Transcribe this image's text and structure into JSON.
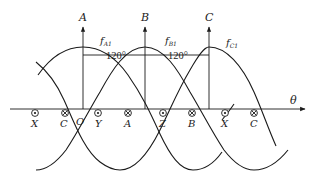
{
  "diagram": {
    "type": "three-phase-mmf-waveforms",
    "horizontal_axis_label": "θ",
    "origin_label": "O",
    "phase_axes": [
      {
        "label": "A",
        "x": 83
      },
      {
        "label": "B",
        "x": 145
      },
      {
        "label": "C",
        "x": 209
      }
    ],
    "waves": [
      {
        "label_main": "f",
        "label_sub": "A1",
        "peak_x": 83
      },
      {
        "label_main": "f",
        "label_sub": "B1",
        "peak_x": 145
      },
      {
        "label_main": "f",
        "label_sub": "C1",
        "peak_x": 209
      }
    ],
    "angle_labels": [
      "120°",
      "120°"
    ],
    "conductor_markers": [
      {
        "label": "X",
        "symbol": "dot",
        "x": 35
      },
      {
        "label": "C",
        "symbol": "cross",
        "x": 65
      },
      {
        "label": "Y",
        "symbol": "dot",
        "x": 98
      },
      {
        "label": "A",
        "symbol": "cross",
        "x": 128
      },
      {
        "label": "Z",
        "symbol": "dot",
        "x": 163
      },
      {
        "label": "B",
        "symbol": "cross",
        "x": 192
      },
      {
        "label": "X",
        "symbol": "dot",
        "x": 225
      },
      {
        "label": "C",
        "symbol": "cross",
        "x": 254
      }
    ],
    "colors": {
      "stroke": "#1a1a1a",
      "background": "#ffffff"
    }
  }
}
